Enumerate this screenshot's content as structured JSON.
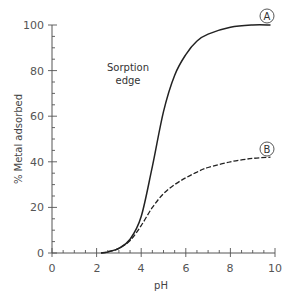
{
  "chart_data": {
    "type": "line",
    "title": "",
    "xlabel": "pH",
    "ylabel": "% Metal adsorbed",
    "xlim": [
      0,
      10
    ],
    "ylim": [
      0,
      100
    ],
    "x_ticks": [
      "0",
      "2",
      "4",
      "6",
      "8",
      "10"
    ],
    "y_ticks": [
      "0",
      "20",
      "40",
      "60",
      "80",
      "100"
    ],
    "grid": false,
    "legend": "none (curves labeled inline with circled letters)",
    "x": [
      2.2,
      2.5,
      3.0,
      3.5,
      4.0,
      4.5,
      5.0,
      5.5,
      6.0,
      6.5,
      7.0,
      8.0,
      9.0,
      9.8
    ],
    "series": [
      {
        "name": "A",
        "style": "solid",
        "values": [
          0,
          0.5,
          2,
          6,
          16,
          38,
          62,
          78,
          87,
          93,
          96,
          99,
          100,
          100
        ]
      },
      {
        "name": "B",
        "style": "dashed",
        "values": [
          0,
          0.5,
          2,
          5.5,
          12,
          20,
          26,
          30,
          33,
          35.5,
          37.5,
          40,
          41.5,
          42
        ]
      }
    ],
    "annotations": [
      {
        "text": "Sorption edge",
        "x": 3.7,
        "y": 78
      },
      {
        "text": "A",
        "shape": "circle",
        "x": 10,
        "y": 103
      },
      {
        "text": "B",
        "shape": "circle",
        "x": 10,
        "y": 46
      }
    ]
  },
  "labels": {
    "xlabel": "pH",
    "ylabel": "% Metal adsorbed",
    "annot_line1": "Sorption",
    "annot_line2": "edge",
    "curve_a": "A",
    "curve_b": "B",
    "xt0": "0",
    "xt2": "2",
    "xt4": "4",
    "xt6": "6",
    "xt8": "8",
    "xt10": "10",
    "yt0": "0",
    "yt20": "20",
    "yt40": "40",
    "yt60": "60",
    "yt80": "80",
    "yt100": "100"
  }
}
